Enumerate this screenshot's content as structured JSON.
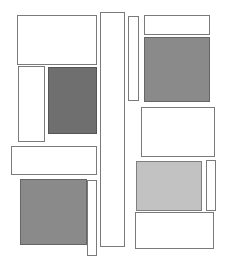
{
  "canvas": {
    "width": 226,
    "height": 268,
    "background": "#ffffff"
  },
  "colors": {
    "outline": "#7a7a7a",
    "dark_fill": "#6f6f6f",
    "mid_fill": "#8a8a8a",
    "light_fill": "#c2c2c2",
    "white_fill": "#ffffff"
  },
  "rects": [
    {
      "id": "top-left-box",
      "x": 17,
      "y": 15,
      "w": 80,
      "h": 50,
      "fill": "white"
    },
    {
      "id": "left-narrow-box",
      "x": 18,
      "y": 66,
      "w": 27,
      "h": 76,
      "fill": "white"
    },
    {
      "id": "left-dark-box",
      "x": 48,
      "y": 67,
      "w": 49,
      "h": 67,
      "fill": "dark"
    },
    {
      "id": "left-wide-box",
      "x": 11,
      "y": 146,
      "w": 86,
      "h": 29,
      "fill": "white"
    },
    {
      "id": "bottom-left-dark-box",
      "x": 20,
      "y": 179,
      "w": 67,
      "h": 66,
      "fill": "mid"
    },
    {
      "id": "bottom-left-narrow-box",
      "x": 87,
      "y": 180,
      "w": 10,
      "h": 76,
      "fill": "white"
    },
    {
      "id": "center-tall-column",
      "x": 100,
      "y": 12,
      "w": 25,
      "h": 235,
      "fill": "white"
    },
    {
      "id": "right-narrow-bar",
      "x": 128,
      "y": 16,
      "w": 11,
      "h": 85,
      "fill": "white"
    },
    {
      "id": "top-right-box",
      "x": 144,
      "y": 15,
      "w": 66,
      "h": 20,
      "fill": "white"
    },
    {
      "id": "right-dark-box",
      "x": 144,
      "y": 37,
      "w": 66,
      "h": 65,
      "fill": "mid"
    },
    {
      "id": "right-middle-box",
      "x": 141,
      "y": 107,
      "w": 74,
      "h": 50,
      "fill": "white"
    },
    {
      "id": "right-light-box",
      "x": 136,
      "y": 161,
      "w": 66,
      "h": 50,
      "fill": "light"
    },
    {
      "id": "right-narrow-box",
      "x": 206,
      "y": 160,
      "w": 10,
      "h": 51,
      "fill": "white"
    },
    {
      "id": "bottom-right-box",
      "x": 135,
      "y": 212,
      "w": 79,
      "h": 37,
      "fill": "white"
    }
  ]
}
